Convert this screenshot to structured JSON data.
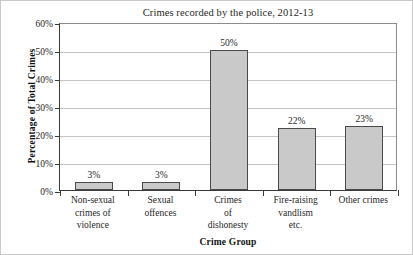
{
  "chart_data": {
    "type": "bar",
    "title": "Crimes recorded by the police, 2012-13",
    "xlabel": "Crime Group",
    "ylabel": "Percentage of Total Crimes",
    "categories": [
      "Non-sexual crimes of violence",
      "Sexual offences",
      "Crimes of dishonesty",
      "Fire-raising vandlism etc.",
      "Other crimes"
    ],
    "category_lines": [
      [
        "Non-sexual",
        "crimes of",
        "violence"
      ],
      [
        "Sexual",
        "offences"
      ],
      [
        "Crimes",
        "of",
        "dishonesty"
      ],
      [
        "Fire-raising",
        "vandlism",
        "etc."
      ],
      [
        "Other crimes"
      ]
    ],
    "values": [
      3,
      3,
      50,
      22,
      23
    ],
    "value_labels": [
      "3%",
      "3%",
      "50%",
      "22%",
      "23%"
    ],
    "ylim": [
      0,
      60
    ],
    "ytick_values": [
      0,
      10,
      20,
      30,
      40,
      50,
      60
    ],
    "ytick_labels": [
      "0%",
      "10%",
      "20%",
      "30%",
      "40%",
      "50%",
      "60%"
    ],
    "grid": true,
    "grid_axis": "y",
    "legend": "none",
    "bar_color": "#c9c9c9",
    "bar_edge_color": "#4a4a4a",
    "axis_color": "#3a3a3a",
    "grid_color": "#c4c4c4",
    "text_color": "#1f1f1f",
    "background": "#ffffff"
  }
}
